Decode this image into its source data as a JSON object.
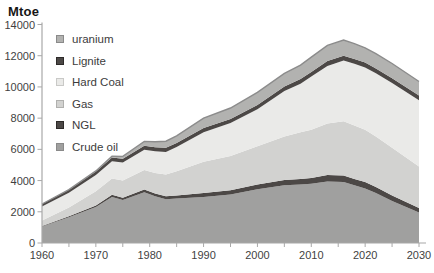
{
  "page_title": "Mtoe",
  "axis": {
    "unit_label": "Mtoe"
  },
  "colors": {
    "background": "#ffffff",
    "axis_line": "#a8a8a8",
    "tick_text": "#3f3f3f",
    "crude_oil": "#a0a09f",
    "ngl": "#4c4846",
    "gas": "#d2d2d0",
    "hard_coal": "#eaeae8",
    "lignite": "#4c4846",
    "uranium": "#b2b2b0",
    "uranium_edge": "#8c8c8c"
  },
  "chart_data": {
    "type": "area",
    "stacked": true,
    "title": "Mtoe",
    "xlabel": "",
    "ylabel": "Mtoe",
    "xlim": [
      1960,
      2030
    ],
    "ylim": [
      0,
      14000
    ],
    "grid": false,
    "legend_position": "top-left-inside",
    "xticks_major": [
      1960,
      1970,
      1980,
      1990,
      2000,
      2010,
      2020,
      2030
    ],
    "xticks_minor_step": 5,
    "yticks": [
      0,
      2000,
      4000,
      6000,
      8000,
      10000,
      12000,
      14000
    ],
    "x": [
      1960,
      1965,
      1970,
      1973,
      1975,
      1979,
      1981,
      1983,
      1985,
      1990,
      1995,
      2000,
      2005,
      2008,
      2010,
      2013,
      2016,
      2018,
      2020,
      2022,
      2025,
      2030
    ],
    "series": [
      {
        "name": "Crude oil",
        "color_key": "crude_oil",
        "values": [
          1050,
          1650,
          2300,
          2950,
          2750,
          3250,
          3000,
          2800,
          2850,
          2950,
          3100,
          3450,
          3700,
          3750,
          3800,
          3950,
          3900,
          3700,
          3500,
          3200,
          2700,
          1950
        ]
      },
      {
        "name": "NGL",
        "color_key": "ngl",
        "values": [
          40,
          70,
          110,
          140,
          150,
          170,
          180,
          190,
          200,
          250,
          280,
          300,
          330,
          350,
          360,
          400,
          420,
          410,
          400,
          380,
          350,
          300
        ]
      },
      {
        "name": "Gas",
        "color_key": "gas",
        "values": [
          350,
          550,
          900,
          1050,
          1100,
          1250,
          1300,
          1400,
          1550,
          2000,
          2200,
          2450,
          2800,
          3000,
          3100,
          3300,
          3480,
          3420,
          3350,
          3250,
          3050,
          2650
        ]
      },
      {
        "name": "Hard Coal",
        "color_key": "hard_coal",
        "values": [
          900,
          950,
          1050,
          1100,
          1150,
          1300,
          1400,
          1450,
          1550,
          1900,
          2100,
          2370,
          2900,
          3100,
          3400,
          3700,
          3900,
          3950,
          4000,
          4050,
          4150,
          4250
        ]
      },
      {
        "name": "Lignite",
        "color_key": "lignite",
        "values": [
          160,
          190,
          230,
          240,
          250,
          260,
          260,
          260,
          260,
          270,
          270,
          280,
          290,
          300,
          300,
          310,
          300,
          310,
          310,
          300,
          300,
          300
        ]
      },
      {
        "name": "uranium",
        "color_key": "uranium",
        "values": [
          0,
          10,
          30,
          80,
          150,
          280,
          350,
          420,
          450,
          630,
          700,
          800,
          850,
          900,
          950,
          1000,
          1000,
          980,
          950,
          950,
          950,
          900
        ]
      }
    ],
    "legend": [
      {
        "label": "uranium",
        "color_key": "uranium",
        "border": "#8a8a8a"
      },
      {
        "label": "Lignite",
        "color_key": "lignite",
        "border": "#2d2a29"
      },
      {
        "label": "Hard Coal",
        "color_key": "hard_coal",
        "border": "#c9c9c7"
      },
      {
        "label": "Gas",
        "color_key": "gas",
        "border": "#b0b0ae"
      },
      {
        "label": "NGL",
        "color_key": "ngl",
        "border": "#2d2a29"
      },
      {
        "label": "Crude oil",
        "color_key": "crude_oil",
        "border": "#8a8a8a"
      }
    ]
  }
}
